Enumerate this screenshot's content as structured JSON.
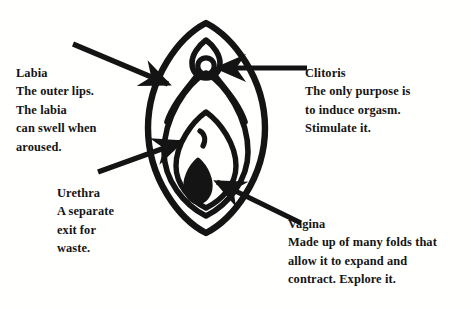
{
  "image": {
    "title": "Vulva anatomy labeled diagram",
    "background_color": "#fffffe",
    "ink_color": "#141414",
    "width": 471,
    "height": 309
  },
  "labels": [
    {
      "id": "labia",
      "title": "Labia",
      "lines": [
        "The outer lips.",
        "The labia",
        "can swell when",
        "aroused."
      ]
    },
    {
      "id": "clitoris",
      "title": "Clitoris",
      "lines": [
        "The only purpose is",
        "to induce orgasm.",
        "Stimulate it."
      ]
    },
    {
      "id": "urethra",
      "title": "Urethra",
      "lines": [
        "A separate",
        "exit for",
        "waste."
      ]
    },
    {
      "id": "vagina",
      "title": "Vagina",
      "lines": [
        "Made up of many folds that",
        "allow it to expand and",
        "contract. Explore it."
      ]
    }
  ],
  "diagram": {
    "parts": [
      "outer-oval",
      "outer-labia-contour",
      "inner-labia-contour",
      "clitoral-hood",
      "clitoral-glans",
      "urethral-opening",
      "vaginal-opening"
    ],
    "arrows": [
      {
        "id": "labia-arrow",
        "from": [
          73,
          44
        ],
        "to": [
          172,
          86
        ]
      },
      {
        "id": "clitoris-arrow",
        "from": [
          307,
          68
        ],
        "to": [
          213,
          68
        ]
      },
      {
        "id": "urethra-arrow",
        "from": [
          98,
          172
        ],
        "to": [
          186,
          140
        ]
      },
      {
        "id": "vagina-arrow",
        "from": [
          301,
          223
        ],
        "to": [
          212,
          179
        ]
      }
    ]
  }
}
